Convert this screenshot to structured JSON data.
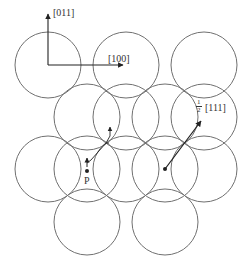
{
  "figure": {
    "axes": {
      "vertical_label": "[011]",
      "horizontal_label": "[100]"
    },
    "burgers_vector": {
      "fraction_numerator": "1",
      "fraction_denominator": "2",
      "direction": "[111]"
    },
    "point_label": "P",
    "colors": {
      "circle_stroke": "#707070",
      "line": "#222222",
      "background": "#ffffff"
    },
    "circle_radius": 33,
    "circles": [
      {
        "row": 1,
        "cx": 48,
        "cy": 65
      },
      {
        "row": 1,
        "cx": 126,
        "cy": 65
      },
      {
        "row": 1,
        "cx": 204,
        "cy": 65
      },
      {
        "row": 2,
        "cx": 87,
        "cy": 117
      },
      {
        "row": 2,
        "cx": 126,
        "cy": 117
      },
      {
        "row": 2,
        "cx": 165,
        "cy": 117
      },
      {
        "row": 2,
        "cx": 204,
        "cy": 117
      },
      {
        "row": 3,
        "cx": 48,
        "cy": 169
      },
      {
        "row": 3,
        "cx": 87,
        "cy": 169
      },
      {
        "row": 3,
        "cx": 126,
        "cy": 169
      },
      {
        "row": 3,
        "cx": 165,
        "cy": 169
      },
      {
        "row": 3,
        "cx": 204,
        "cy": 169
      },
      {
        "row": 4,
        "cx": 87,
        "cy": 222
      },
      {
        "row": 4,
        "cx": 165,
        "cy": 222
      }
    ]
  }
}
